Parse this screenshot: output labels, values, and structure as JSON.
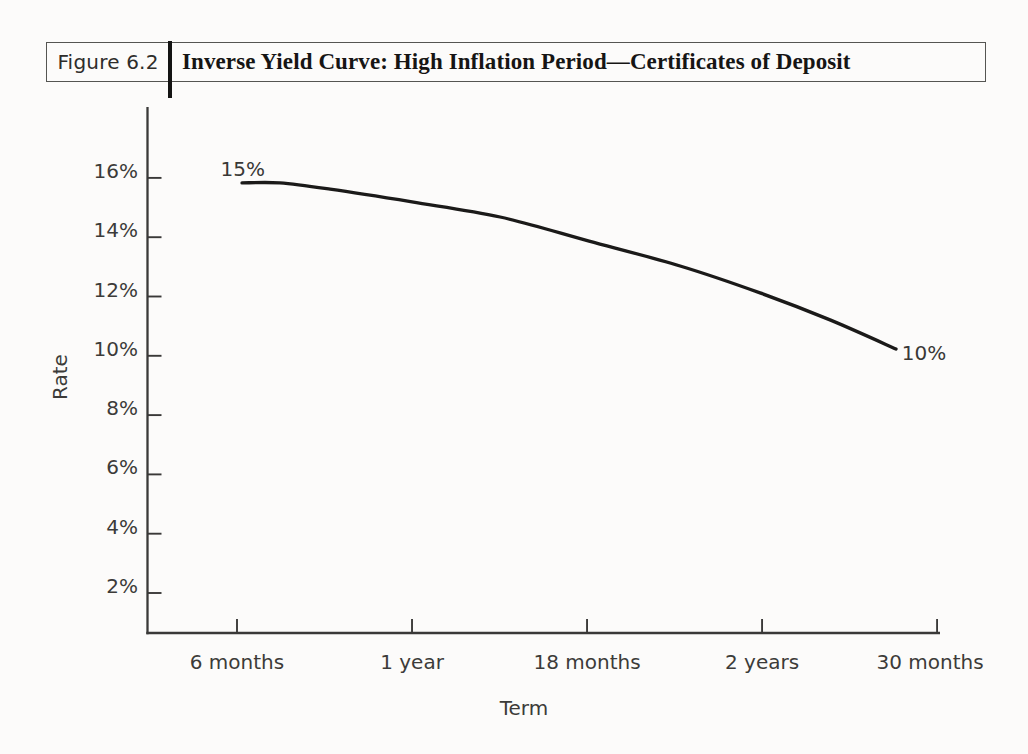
{
  "header": {
    "figure_label": "Figure 6.2",
    "title": "Inverse Yield Curve: High Inflation Period—Certificates of Deposit"
  },
  "chart_data": {
    "type": "line",
    "title": "Inverse Yield Curve: High Inflation Period—Certificates of Deposit",
    "figure_number": "Figure 6.2",
    "xlabel": "Term",
    "ylabel": "Rate",
    "x_tick_labels": [
      "6 months",
      "1 year",
      "18 months",
      "2 years",
      "30 months"
    ],
    "x_tick_months": [
      6,
      12,
      18,
      24,
      30
    ],
    "y_tick_labels": [
      "2%",
      "4%",
      "6%",
      "8%",
      "10%",
      "12%",
      "14%",
      "16%"
    ],
    "y_tick_pcts": [
      2,
      4,
      6,
      8,
      10,
      12,
      14,
      16
    ],
    "ylim_pct": [
      0.6,
      18.4
    ],
    "xlim_months": [
      2.9,
      30.1
    ],
    "grid": false,
    "legend": false,
    "series": [
      {
        "name": "CD yield curve",
        "start_label": "15%",
        "end_label": "10%",
        "points_months_rate": [
          [
            6.17,
            15.83
          ],
          [
            7.47,
            15.83
          ],
          [
            9.19,
            15.62
          ],
          [
            12.0,
            15.19
          ],
          [
            15.02,
            14.68
          ],
          [
            18.07,
            13.87
          ],
          [
            21.19,
            13.03
          ],
          [
            23.93,
            12.12
          ],
          [
            26.33,
            11.21
          ],
          [
            28.59,
            10.23
          ]
        ]
      }
    ],
    "annotations": [
      {
        "text": "15%",
        "months": 6.2,
        "rate": 16.3
      },
      {
        "text": "10%",
        "months": 29.55,
        "rate": 10.1
      }
    ],
    "colors": {
      "axis": "#3a3938",
      "curve": "#1b1a19",
      "text": "#3c3b39"
    }
  }
}
